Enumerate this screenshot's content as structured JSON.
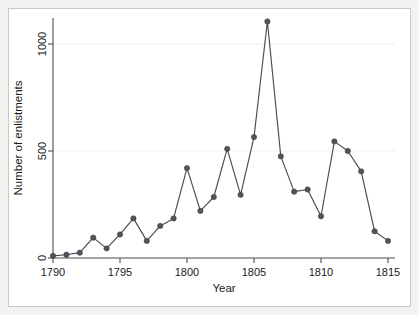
{
  "figure": {
    "background_color": "#f2f2f0",
    "plot_background_color": "#ffffff",
    "border_color": "#c9c9c9"
  },
  "chart_data": {
    "type": "line",
    "title": "",
    "subtitle": "",
    "xlabel": "Year",
    "ylabel": "Number of enlistments",
    "xlim": [
      1790,
      1815
    ],
    "ylim": [
      0,
      1150
    ],
    "xticks": [
      1790,
      1795,
      1800,
      1805,
      1810,
      1815
    ],
    "xtick_labels": [
      "1790",
      "1795",
      "1800",
      "1805",
      "1810",
      "1815"
    ],
    "yticks": [
      0,
      500,
      1000
    ],
    "ytick_labels": [
      "0",
      "500",
      "1000"
    ],
    "grid": "horizontal-faint",
    "legend": "none",
    "marker": "filled-circle",
    "line_color": "#4a4a52",
    "marker_color": "#53535c",
    "x": [
      1790,
      1791,
      1792,
      1793,
      1794,
      1795,
      1796,
      1797,
      1798,
      1799,
      1800,
      1801,
      1802,
      1803,
      1804,
      1805,
      1806,
      1807,
      1808,
      1809,
      1810,
      1811,
      1812,
      1813,
      1814,
      1815
    ],
    "values": [
      10,
      15,
      25,
      95,
      45,
      110,
      185,
      80,
      150,
      185,
      420,
      220,
      285,
      510,
      295,
      565,
      1105,
      475,
      310,
      320,
      195,
      545,
      500,
      405,
      125,
      80
    ],
    "series": [
      {
        "name": "Number of enlistments",
        "values": [
          10,
          15,
          25,
          95,
          45,
          110,
          185,
          80,
          150,
          185,
          420,
          220,
          285,
          510,
          295,
          565,
          1105,
          475,
          310,
          320,
          195,
          545,
          500,
          405,
          125,
          80
        ]
      }
    ]
  }
}
